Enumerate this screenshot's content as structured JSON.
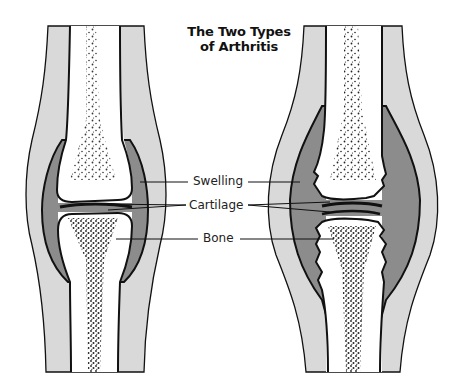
{
  "title": {
    "line1": "The Two Types",
    "line2": "of Arthritis"
  },
  "labels": {
    "swelling": "Swelling",
    "cartilage": "Cartilage",
    "bone": "Bone"
  },
  "panels": [
    {
      "name": "left-joint",
      "description": "joint with smooth cartilage and thin synovial lining"
    },
    {
      "name": "right-joint",
      "description": "joint with thinned cartilage, eroded bone ends and thick swollen synovium"
    }
  ],
  "colors": {
    "soft_tissue": "#d9d9d9",
    "synovium": "#8c8c8c",
    "bone": "#ffffff",
    "outline": "#111111",
    "marrow_dots": "#222222"
  }
}
